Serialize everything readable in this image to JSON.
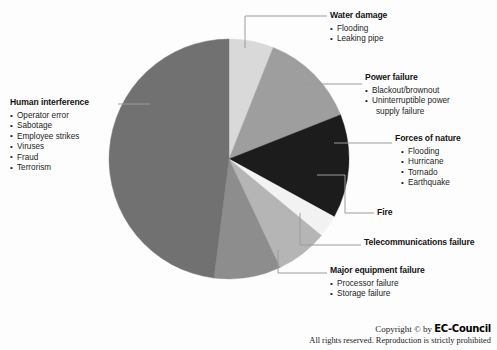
{
  "chart_data": {
    "type": "pie",
    "title": "",
    "legend_position": "callout-labels",
    "categories": [
      "Water damage",
      "Power failure",
      "Forces of nature",
      "Fire",
      "Telecommunications failure",
      "Major equipment failure",
      "Human interference"
    ],
    "values": [
      6,
      13,
      14,
      3,
      7,
      9,
      48
    ],
    "colors": [
      "#d9d9d9",
      "#9e9e9e",
      "#1c1c1c",
      "#f2f2f2",
      "#b5b5b5",
      "#8d8d8d",
      "#717171"
    ],
    "start_angle_deg": 0,
    "units": "percent"
  },
  "pie": {
    "center_x": 229,
    "center_y": 159,
    "radius": 120,
    "slices": [
      {
        "name": "water-damage",
        "label": "Water damage",
        "value": 6,
        "color": "#d9d9d9"
      },
      {
        "name": "power-failure",
        "label": "Power failure",
        "value": 13,
        "color": "#9e9e9e"
      },
      {
        "name": "forces-nature",
        "label": "Forces of nature",
        "value": 14,
        "color": "#1c1c1c"
      },
      {
        "name": "fire",
        "label": "Fire",
        "value": 3,
        "color": "#f2f2f2"
      },
      {
        "name": "telecom",
        "label": "Telecommunications failure",
        "value": 7,
        "color": "#b5b5b5"
      },
      {
        "name": "major-equip",
        "label": "Major equipment failure",
        "value": 9,
        "color": "#8d8d8d"
      },
      {
        "name": "human",
        "label": "Human interference",
        "value": 48,
        "color": "#717171"
      }
    ]
  },
  "labels": {
    "human": {
      "title": "Human interference",
      "bullets": [
        "Operator error",
        "Sabotage",
        "Employee strikes",
        "Viruses",
        "Fraud",
        "Terrorism"
      ]
    },
    "water": {
      "title": "Water damage",
      "bullets": [
        "Flooding",
        "Leaking pipe"
      ]
    },
    "power": {
      "title": "Power failure",
      "bullets": [
        "Blackout/brownout",
        "Uninterruptible power"
      ],
      "bullet_2_cont": "supply failure"
    },
    "forces": {
      "title": "Forces of nature",
      "bullets": [
        "Flooding",
        "Hurricane",
        "Tornado",
        "Earthquake"
      ]
    },
    "fire": {
      "title": "Fire"
    },
    "telecom": {
      "title": "Telecommunications failure"
    },
    "majoreq": {
      "title": "Major equipment failure",
      "bullets": [
        "Processor failure",
        "Storage failure"
      ]
    }
  },
  "footer": {
    "copyright_prefix": "Copyright © by ",
    "brand": "EC-Council",
    "rights": "All rights reserved. Reproduction is strictly prohibited"
  }
}
